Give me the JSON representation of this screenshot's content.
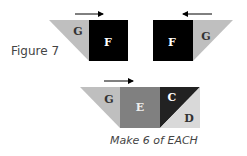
{
  "figure_label": "Figure 7",
  "note": "Make 6 of EACH",
  "colors": {
    "G": "#bfbfbf",
    "F": "#000000",
    "E": "#808080",
    "C": "#222222",
    "D": "#d9d9d9",
    "outline": "#333333"
  },
  "units": [
    {
      "name": "unit-1",
      "arrow": "right",
      "pieces": [
        {
          "label": "G",
          "shape": "triangle"
        },
        {
          "label": "F",
          "shape": "square"
        }
      ]
    },
    {
      "name": "unit-2",
      "arrow": "left",
      "pieces": [
        {
          "label": "F",
          "shape": "square"
        },
        {
          "label": "G",
          "shape": "triangle"
        }
      ]
    },
    {
      "name": "unit-3",
      "arrow": "right",
      "pieces": [
        {
          "label": "G",
          "shape": "triangle"
        },
        {
          "label": "E",
          "shape": "square"
        },
        {
          "label": "C",
          "shape": "half-square-triangle"
        },
        {
          "label": "D",
          "shape": "half-square-triangle"
        }
      ]
    }
  ]
}
